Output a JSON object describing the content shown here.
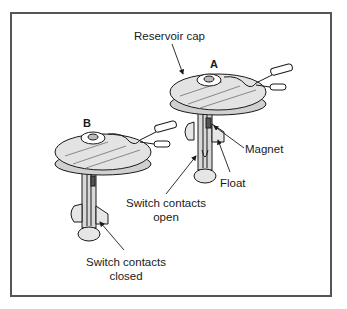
{
  "figure": {
    "labels": {
      "reservoir_cap": "Reservoir cap",
      "assembly_a": "A",
      "assembly_b": "B",
      "magnet": "Magnet",
      "float": "Float",
      "switch_open_line1": "Switch contacts",
      "switch_open_line2": "open",
      "switch_closed_line1": "Switch contacts",
      "switch_closed_line2": "closed"
    }
  }
}
